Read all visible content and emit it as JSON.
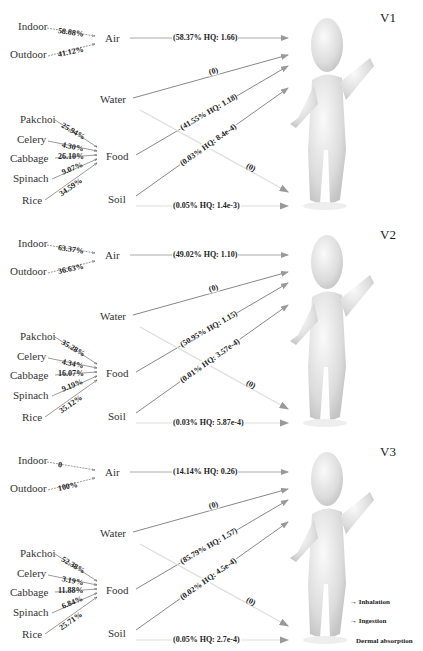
{
  "scenarios": [
    {
      "title": "V1",
      "air_sources": [
        {
          "label": "Indoor",
          "pct": "58.88%"
        },
        {
          "label": "Outdoor",
          "pct": "41.12%"
        }
      ],
      "food_sources": [
        {
          "label": "Pakchoi",
          "pct": "25.94%"
        },
        {
          "label": "Celery",
          "pct": "4.30%"
        },
        {
          "label": "Cabbage",
          "pct": "26.10%"
        },
        {
          "label": "Spinach",
          "pct": "9.07%"
        },
        {
          "label": "Rice",
          "pct": "34.59%"
        }
      ],
      "media": {
        "air": "Air",
        "water": "Water",
        "food": "Food",
        "soil": "Soil"
      },
      "flows": {
        "air": "(58.37%  HQ: 1.66)",
        "water": "(0)",
        "food": "(41.55%  HQ: 1.18)",
        "soil_ingestion": "(0.03%  HQ: 8.4e-4)",
        "water_dermal": "(0)",
        "soil_dermal": "(0.05%  HQ: 1.4e-3)"
      }
    },
    {
      "title": "V2",
      "air_sources": [
        {
          "label": "Indoor",
          "pct": "63.37%"
        },
        {
          "label": "Outdoor",
          "pct": "36.63%"
        }
      ],
      "food_sources": [
        {
          "label": "Pakchoi",
          "pct": "35.28%"
        },
        {
          "label": "Celery",
          "pct": "4.34%"
        },
        {
          "label": "Cabbage",
          "pct": "16.07%"
        },
        {
          "label": "Spinach",
          "pct": "9.19%"
        },
        {
          "label": "Rice",
          "pct": "35.12%"
        }
      ],
      "media": {
        "air": "Air",
        "water": "Water",
        "food": "Food",
        "soil": "Soil"
      },
      "flows": {
        "air": "(49.02%  HQ: 1.10)",
        "water": "(0)",
        "food": "(50.95%  HQ: 1.15)",
        "soil_ingestion": "(0.01%  HQ: 3.57e-4)",
        "water_dermal": "(0)",
        "soil_dermal": "(0.03%  HQ: 5.87e-4)"
      }
    },
    {
      "title": "V3",
      "air_sources": [
        {
          "label": "Indoor",
          "pct": "0"
        },
        {
          "label": "Outdoor",
          "pct": "100%"
        }
      ],
      "food_sources": [
        {
          "label": "Pakchoi",
          "pct": "52.38%"
        },
        {
          "label": "Celery",
          "pct": "3.19%"
        },
        {
          "label": "Cabbage",
          "pct": "11.88%"
        },
        {
          "label": "Spinach",
          "pct": "6.84%"
        },
        {
          "label": "Rice",
          "pct": "25.71%"
        }
      ],
      "media": {
        "air": "Air",
        "water": "Water",
        "food": "Food",
        "soil": "Soil"
      },
      "flows": {
        "air": "(14.14%  HQ: 0.26)",
        "water": "(0)",
        "food": "(85.79%  HQ: 1.57)",
        "soil_ingestion": "(0.02%  HQ: 4.5e-4)",
        "water_dermal": "(0)",
        "soil_dermal": "(0.05%  HQ: 2.7e-4)"
      }
    }
  ],
  "legend": {
    "inhalation": "Inhalation",
    "ingestion": "Ingestion",
    "dermal": "Dermal absorption"
  },
  "colors": {
    "inhalation_line": "#9a9a9a",
    "ingestion_line": "#7a7a7a",
    "dermal_line": "#d8d8d8",
    "figure": "#e4e4e4"
  }
}
